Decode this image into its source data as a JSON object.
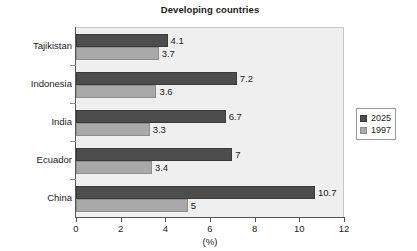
{
  "chart_data": {
    "type": "bar",
    "orientation": "horizontal",
    "title": "Developing countries",
    "xlabel": "(%)",
    "ylabel": "",
    "xlim": [
      0,
      12
    ],
    "xticks": [
      0,
      2,
      4,
      6,
      8,
      10,
      12
    ],
    "xtick_labels": [
      "0",
      "2",
      "4",
      "6",
      "8",
      "10",
      "12"
    ],
    "grid": false,
    "legend_position": "right",
    "categories": [
      "Tajikistan",
      "Indonesia",
      "India",
      "Ecuador",
      "China"
    ],
    "series": [
      {
        "name": "2025",
        "color": "#4d4d4d",
        "values": [
          4.1,
          7.2,
          6.7,
          7,
          10.7
        ],
        "value_labels": [
          "4.1",
          "7.2",
          "6.7",
          "7",
          "10.7"
        ]
      },
      {
        "name": "1997",
        "color": "#a9a9a9",
        "values": [
          3.7,
          3.6,
          3.3,
          3.4,
          5
        ],
        "value_labels": [
          "3.7",
          "3.6",
          "3.3",
          "3.4",
          "5"
        ]
      }
    ]
  },
  "legend": {
    "entries": [
      {
        "label": "2025"
      },
      {
        "label": "1997"
      }
    ]
  }
}
